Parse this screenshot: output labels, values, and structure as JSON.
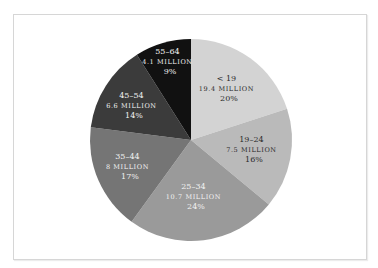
{
  "chart_data": {
    "type": "pie",
    "title": "",
    "start_angle": "12 o'clock",
    "direction": "clockwise",
    "categories": [
      "< 19",
      "19–24",
      "25–34",
      "35–44",
      "45–54",
      "55–64"
    ],
    "values_millions": [
      19.4,
      7.5,
      10.7,
      8,
      6.6,
      4.1
    ],
    "percent": [
      20,
      16,
      24,
      17,
      14,
      9
    ],
    "slices": [
      {
        "range": "< 19",
        "value": "19.4 MILLION",
        "pct": "20%",
        "percent": 20,
        "color": "#d3d3d3",
        "text_color": "#2a2a2a"
      },
      {
        "range": "19–24",
        "value": "7.5 MILLION",
        "pct": "16%",
        "percent": 16,
        "color": "#bababa",
        "text_color": "#2a2a2a"
      },
      {
        "range": "25–34",
        "value": "10.7 MILLION",
        "pct": "24%",
        "percent": 24,
        "color": "#9a9a9a",
        "text_color": "#f2f2f2"
      },
      {
        "range": "35–44",
        "value": "8 MILLION",
        "pct": "17%",
        "percent": 17,
        "color": "#757575",
        "text_color": "#f2f2f2"
      },
      {
        "range": "45–54",
        "value": "6.6 MILLION",
        "pct": "14%",
        "percent": 14,
        "color": "#3b3b3b",
        "text_color": "#f2f2f2"
      },
      {
        "range": "55–64",
        "value": "4.1 MILLION",
        "pct": "9%",
        "percent": 9,
        "color": "#111111",
        "text_color": "#f2f2f2"
      }
    ],
    "legend": "none (inline labels)",
    "grid": false
  }
}
